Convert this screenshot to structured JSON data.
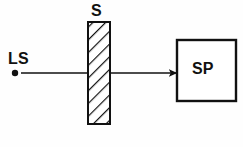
{
  "diagram": {
    "type": "optics-schematic",
    "background_color": "#fefefe",
    "stroke_color": "#111111",
    "components": [
      {
        "id": "light-source",
        "label": "LS",
        "meaning": "light source",
        "shape": "point",
        "x": 15,
        "y": 73,
        "radius": 3.2,
        "label_x": 8,
        "label_y": 50
      },
      {
        "id": "sample",
        "label": "S",
        "meaning": "sample slab",
        "shape": "hatched-rectangle",
        "x": 88,
        "y": 22,
        "width": 22,
        "height": 102,
        "hatch_angle_deg": 45,
        "hatch_spacing": 9,
        "label_x": 91,
        "label_y": 2
      },
      {
        "id": "spectrometer",
        "label": "SP",
        "meaning": "spectrometer / detector",
        "shape": "rectangle",
        "x": 177,
        "y": 40,
        "width": 59,
        "height": 61,
        "label_x": 192,
        "label_y": 60
      }
    ],
    "ray": {
      "id": "beam",
      "from_x": 21,
      "to_x": 177,
      "y": 73,
      "arrowhead": "filled-triangle",
      "stroke_width": 1.6
    }
  }
}
